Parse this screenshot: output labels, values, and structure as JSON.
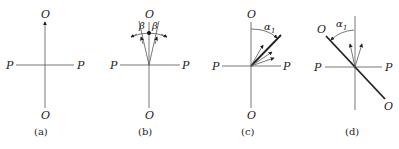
{
  "panels": [
    {
      "id": "a",
      "caption": "(a)",
      "labels": {
        "top": "O",
        "bottom": "O",
        "left": "P",
        "right": "P"
      }
    },
    {
      "id": "b",
      "caption": "(b)",
      "labels": {
        "top": "O",
        "bottom": "O",
        "left": "P",
        "right": "P",
        "angle_left": "β",
        "angle_right": "β"
      }
    },
    {
      "id": "c",
      "caption": "(c)",
      "labels": {
        "top": "O",
        "bottom": "O",
        "left": "P",
        "right": "P",
        "angle": "α",
        "angle_sub": "1"
      }
    },
    {
      "id": "d",
      "caption": "(d)",
      "labels": {
        "top": "O",
        "bottom": "O",
        "left": "P",
        "right": "P",
        "angle": "α",
        "angle_sub": "1"
      }
    }
  ]
}
